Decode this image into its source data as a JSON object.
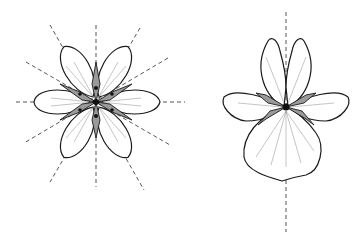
{
  "figure": {
    "background": "#ffffff",
    "line_color": "#1a1a1a",
    "shading_color": "#9a9a9a",
    "flowers": [
      {
        "name": "radial-flower",
        "symmetry": "radial (actinomorphic)",
        "center": [
          96,
          102
        ],
        "petal_count": 8,
        "symmetry_axes": 4,
        "axis_style": "dashed"
      },
      {
        "name": "bilateral-flower",
        "symmetry": "bilateral (zygomorphic)",
        "center": [
          286,
          107
        ],
        "petal_count": 5,
        "symmetry_axes": 1,
        "axis_style": "dashed"
      }
    ]
  }
}
